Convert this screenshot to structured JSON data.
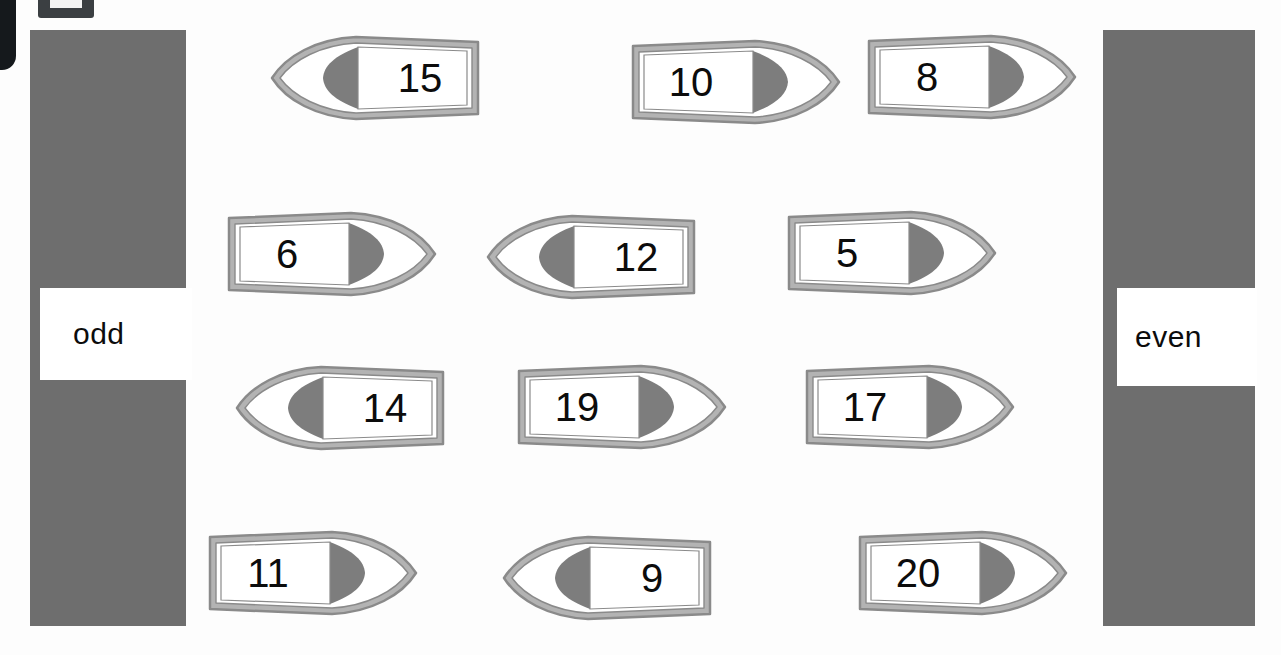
{
  "worksheet": {
    "title": "odd and even number sorting worksheet",
    "columns": [
      {
        "id": "odd",
        "label": "odd",
        "color": "#6e6e6e"
      },
      {
        "id": "even",
        "label": "even",
        "color": "#6e6e6e"
      }
    ],
    "colors": {
      "column_grey": "#6e6e6e",
      "boat_hull": "#b3b3b3",
      "boat_outline": "#8a8a8a",
      "boat_sail_shadow": "#7d7d7d",
      "boat_fill": "#ffffff",
      "number_text": "#0c0c0c",
      "page_background": "#fdfdfd"
    },
    "boats": [
      {
        "number": "15",
        "direction": "left",
        "x": 268,
        "y": 32,
        "w": 216,
        "h": 92
      },
      {
        "number": "10",
        "direction": "right",
        "x": 627,
        "y": 36,
        "w": 216,
        "h": 92
      },
      {
        "number": "8",
        "direction": "right",
        "x": 863,
        "y": 31,
        "w": 216,
        "h": 92
      },
      {
        "number": "6",
        "direction": "right",
        "x": 223,
        "y": 208,
        "w": 216,
        "h": 92
      },
      {
        "number": "12",
        "direction": "left",
        "x": 484,
        "y": 211,
        "w": 216,
        "h": 92
      },
      {
        "number": "5",
        "direction": "right",
        "x": 783,
        "y": 207,
        "w": 216,
        "h": 92
      },
      {
        "number": "14",
        "direction": "left",
        "x": 233,
        "y": 362,
        "w": 216,
        "h": 92
      },
      {
        "number": "19",
        "direction": "right",
        "x": 513,
        "y": 361,
        "w": 216,
        "h": 92
      },
      {
        "number": "17",
        "direction": "right",
        "x": 801,
        "y": 361,
        "w": 216,
        "h": 92
      },
      {
        "number": "11",
        "direction": "right",
        "x": 204,
        "y": 527,
        "w": 216,
        "h": 92
      },
      {
        "number": "9",
        "direction": "left",
        "x": 500,
        "y": 532,
        "w": 216,
        "h": 92
      },
      {
        "number": "20",
        "direction": "right",
        "x": 854,
        "y": 527,
        "w": 216,
        "h": 92
      }
    ]
  }
}
